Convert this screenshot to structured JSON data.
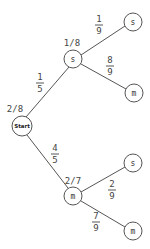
{
  "diagram": {
    "type": "probability-tree",
    "root": {
      "label": "Start",
      "count": "2/8",
      "cx": 22,
      "cy": 126,
      "r": 10
    },
    "level1": [
      {
        "id": "s1",
        "label": "s",
        "count": "1/8",
        "cx": 73,
        "cy": 59,
        "r": 9,
        "edge_prob": {
          "num": "1",
          "den": "5",
          "x": 40,
          "y": 80
        },
        "children": [
          {
            "id": "ss",
            "label": "s",
            "cx": 133,
            "cy": 22,
            "r": 9,
            "edge_prob": {
              "num": "1",
              "den": "9",
              "x": 99,
              "y": 20
            }
          },
          {
            "id": "sm",
            "label": "m",
            "cx": 134,
            "cy": 93,
            "r": 9,
            "edge_prob": {
              "num": "8",
              "den": "9",
              "x": 110,
              "y": 62
            }
          }
        ]
      },
      {
        "id": "m1",
        "label": "m",
        "count": "2/7",
        "cx": 73,
        "cy": 196,
        "r": 9,
        "edge_prob": {
          "num": "4",
          "den": "5",
          "x": 55,
          "y": 151
        },
        "children": [
          {
            "id": "ms",
            "label": "s",
            "cx": 133,
            "cy": 163,
            "r": 9,
            "edge_prob": {
              "num": "2",
              "den": "9",
              "x": 112,
              "y": 187
            }
          },
          {
            "id": "mm",
            "label": "m",
            "cx": 133,
            "cy": 231,
            "r": 9,
            "edge_prob": {
              "num": "7",
              "den": "9",
              "x": 96,
              "y": 219
            }
          }
        ]
      }
    ],
    "colors": {
      "line": "#555555",
      "text": "#444444",
      "background": "#ffffff"
    }
  }
}
